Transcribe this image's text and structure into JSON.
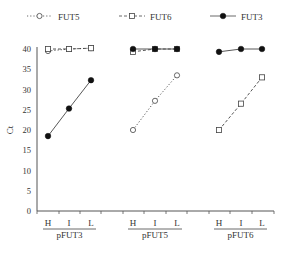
{
  "chart_data": {
    "type": "line",
    "title": "",
    "ylabel": "Ct",
    "xlabel": "",
    "ylim": [
      0,
      40
    ],
    "yticks": [
      0,
      5,
      10,
      15,
      20,
      25,
      30,
      35,
      40
    ],
    "grid": false,
    "legend_position": "top",
    "legend": [
      {
        "name": "FUT5",
        "style": "dotted",
        "marker": "open-circle"
      },
      {
        "name": "FUT6",
        "style": "dashed",
        "marker": "open-square"
      },
      {
        "name": "FUT3",
        "style": "solid",
        "marker": "filled-circle"
      }
    ],
    "groups": [
      {
        "label": "pFUT3",
        "categories": [
          "H",
          "I",
          "L"
        ],
        "series": [
          {
            "name": "FUT5",
            "values": [
              39.5,
              40,
              40.2
            ]
          },
          {
            "name": "FUT6",
            "values": [
              40,
              40,
              40.2
            ]
          },
          {
            "name": "FUT3",
            "values": [
              18.5,
              25.3,
              32.3
            ]
          }
        ]
      },
      {
        "label": "pFUT5",
        "categories": [
          "H",
          "I",
          "L"
        ],
        "series": [
          {
            "name": "FUT6",
            "values": [
              39.3,
              40,
              40
            ]
          },
          {
            "name": "FUT3",
            "values": [
              40,
              40,
              40
            ]
          },
          {
            "name": "FUT5",
            "values": [
              20,
              27.2,
              33.5
            ]
          }
        ]
      },
      {
        "label": "pFUT6",
        "categories": [
          "H",
          "I",
          "L"
        ],
        "series": [
          {
            "name": "FUT3",
            "values": [
              39.3,
              40,
              40
            ]
          },
          {
            "name": "FUT6",
            "values": [
              20,
              26.5,
              33
            ]
          }
        ]
      }
    ]
  }
}
